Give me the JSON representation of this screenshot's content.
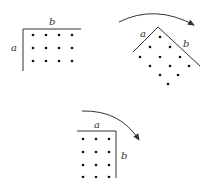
{
  "diagram": {
    "panels": [
      {
        "id": "original",
        "label_a": "a",
        "label_b": "b",
        "rows": 3,
        "cols": 4
      },
      {
        "id": "rotating",
        "label_a": "a",
        "label_b": "b",
        "arrow": "clockwise"
      },
      {
        "id": "rotated",
        "label_a": "a",
        "label_b": "b",
        "rows": 4,
        "cols": 3,
        "arrow": "clockwise"
      }
    ],
    "colors": {
      "line": "#333333",
      "dot": "#111111"
    }
  }
}
